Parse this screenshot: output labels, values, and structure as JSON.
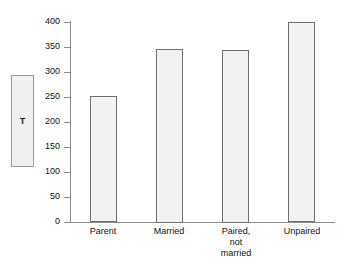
{
  "chart_data": {
    "type": "bar",
    "title": "",
    "subtitle": "",
    "xlabel": "",
    "ylabel": "T",
    "categories": [
      "Parent",
      "Married",
      "Paired,\nnot\nmarried",
      "Unpaired"
    ],
    "values": [
      252,
      347,
      345,
      400
    ],
    "ylim": [
      0,
      400
    ],
    "yticks": [
      0,
      50,
      100,
      150,
      200,
      250,
      300,
      350,
      400
    ],
    "ytick_labels": [
      "0",
      "50",
      "100",
      "150",
      "200",
      "250",
      "300",
      "350",
      "400"
    ],
    "grid": false,
    "legend": null,
    "bar_fill_color": "#f2f2f2",
    "bar_edge_color": "#6e6e6e",
    "axis_color": "#8c8c8c",
    "background_color": "#ffffff"
  },
  "ylabel_box": {
    "text": "T"
  }
}
